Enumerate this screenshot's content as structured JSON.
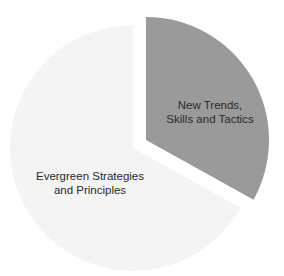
{
  "chart_data": {
    "type": "pie",
    "title": "",
    "exploded": true,
    "slices": [
      {
        "label": "New Trends, Skills and Tactics",
        "label_lines": [
          "New Trends,",
          "Skills and Tactics"
        ],
        "value": 33,
        "color": "#9a9a9a",
        "start_angle_deg": 0,
        "end_angle_deg": 119,
        "center": [
          146,
          140
        ],
        "radius": 123
      },
      {
        "label": "Evergreen Strategies and Principles",
        "label_lines": [
          "Evergreen Strategies",
          "and Principles"
        ],
        "value": 67,
        "color": "#f4f4f4",
        "start_angle_deg": 119,
        "end_angle_deg": 360,
        "center": [
          133,
          148
        ],
        "radius": 123
      }
    ],
    "legend": "none",
    "grid": false
  }
}
